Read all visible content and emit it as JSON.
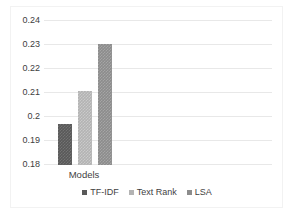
{
  "chart_data": {
    "type": "bar",
    "title": "",
    "subtitle": "",
    "xlabel": "",
    "ylabel": "",
    "categories": [
      "Models"
    ],
    "series": [
      {
        "name": "TF-IDF",
        "values": [
          0.197
        ],
        "color": "#595959"
      },
      {
        "name": "Text Rank",
        "values": [
          0.2105
        ],
        "color": "#b3b3b3"
      },
      {
        "name": "LSA",
        "values": [
          0.23
        ],
        "color": "#8c8c8c"
      }
    ],
    "ylim": [
      0.18,
      0.24
    ],
    "ytick_labels": [
      "0.24",
      "0.23",
      "0.22",
      "0.21",
      "0.2",
      "0.19",
      "0.18"
    ],
    "ytick_values": [
      0.24,
      0.23,
      0.22,
      0.21,
      0.2,
      0.19,
      0.18
    ],
    "grid": true,
    "legend_position": "bottom",
    "annotations": []
  },
  "axis": {
    "category_label": "Models"
  },
  "legend": {
    "entries": [
      {
        "label": "TF-IDF",
        "swatch": "legend-swatch-tfidf"
      },
      {
        "label": "Text Rank",
        "swatch": "legend-swatch-textrank"
      },
      {
        "label": "LSA",
        "swatch": "legend-swatch-lsa"
      }
    ]
  },
  "colors": {
    "tfidf": "#595959",
    "textrank": "#b3b3b3",
    "lsa": "#8c8c8c",
    "gridline": "#e8e8e8",
    "text": "#3f3f3f",
    "background": "#ffffff"
  }
}
